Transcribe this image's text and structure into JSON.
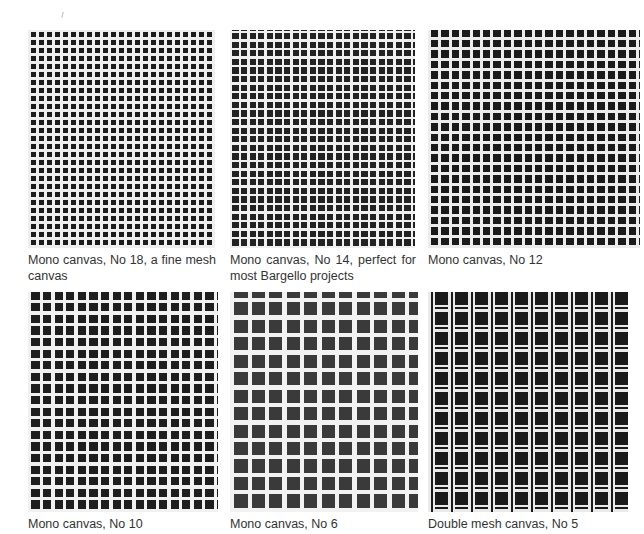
{
  "figures": [
    {
      "caption": "Mono canvas, No 18, a fine mesh canvas",
      "mesh": 18,
      "type": "mono",
      "cell": 8.0,
      "thread": 2.6,
      "hole": "#1c1c1c",
      "thread_color": "#efefef"
    },
    {
      "caption": "Mono canvas, No 14, perfect for most Bargello projects",
      "mesh": 14,
      "type": "mono",
      "cell": 8.6,
      "thread": 2.4,
      "hole": "#222222",
      "thread_color": "#f0f0f0"
    },
    {
      "caption": "Mono canvas, No 12",
      "mesh": 12,
      "type": "mono",
      "cell": 10.4,
      "thread": 3.0,
      "hole": "#1a1a1a",
      "thread_color": "#ececec"
    },
    {
      "caption": "Mono canvas, No 10",
      "mesh": 10,
      "type": "mono",
      "cell": 11.6,
      "thread": 3.4,
      "hole": "#1e1e1e",
      "thread_color": "#f1f1f1"
    },
    {
      "caption": "Mono canvas, No 6",
      "mesh": 6,
      "type": "mono",
      "cell": 17.5,
      "thread": 4.2,
      "hole": "#3a3a3a",
      "thread_color": "#f2f2f2"
    },
    {
      "caption": "Double mesh canvas, No 5",
      "mesh": 5,
      "type": "double",
      "cell": 20.0,
      "thread": 2.6,
      "hole": "#1a1a1a",
      "thread_color": "#eaeaea"
    }
  ]
}
